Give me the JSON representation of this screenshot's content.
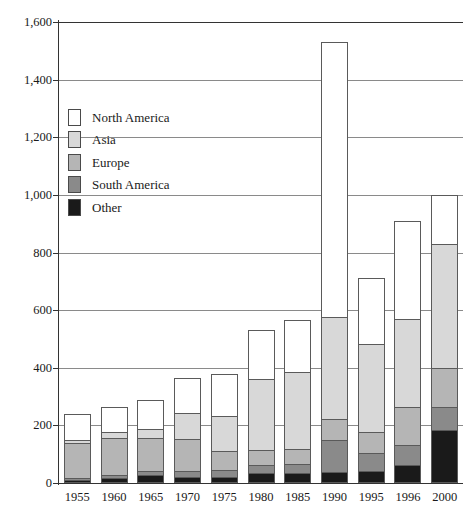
{
  "chart_data": {
    "type": "bar",
    "subtype": "stacked-bar",
    "title": "",
    "xlabel": "",
    "ylabel": "",
    "ylim": [
      0,
      1600
    ],
    "ytick_step": 200,
    "ytick_labels": [
      "0",
      "200",
      "400",
      "600",
      "800",
      "1,000",
      "1,200",
      "1,400",
      "1,600"
    ],
    "ytick_values": [
      0,
      200,
      400,
      600,
      800,
      1000,
      1200,
      1400,
      1600
    ],
    "grid": true,
    "grid_axis": "y",
    "legend_position": "upper-left-inside",
    "categories": [
      "1955",
      "1960",
      "1965",
      "1970",
      "1975",
      "1980",
      "1985",
      "1990",
      "1995",
      "1996",
      "2000"
    ],
    "series": [
      {
        "name": "Other",
        "color": "#1a1a1a",
        "values": [
          10,
          18,
          28,
          22,
          22,
          35,
          35,
          38,
          40,
          62,
          185
        ]
      },
      {
        "name": "South America",
        "color": "#8a8a8a",
        "values": [
          8,
          10,
          12,
          20,
          22,
          28,
          30,
          110,
          65,
          70,
          80
        ]
      },
      {
        "name": "Europe",
        "color": "#b5b5b5",
        "values": [
          122,
          130,
          118,
          112,
          66,
          52,
          52,
          75,
          72,
          133,
          135
        ]
      },
      {
        "name": "Asia",
        "color": "#d8d8d8",
        "values": [
          10,
          20,
          30,
          88,
          122,
          245,
          268,
          352,
          305,
          305,
          430
        ]
      },
      {
        "name": "North America",
        "color": "#ffffff",
        "values": [
          90,
          85,
          100,
          122,
          148,
          170,
          180,
          955,
          230,
          340,
          170
        ]
      }
    ],
    "totals": [
      240,
      263,
      288,
      364,
      380,
      530,
      565,
      1530,
      712,
      910,
      1000
    ]
  },
  "legend": {
    "items": [
      {
        "label": "North America",
        "color": "#ffffff"
      },
      {
        "label": "Asia",
        "color": "#d8d8d8"
      },
      {
        "label": "Europe",
        "color": "#b5b5b5"
      },
      {
        "label": "South America",
        "color": "#8a8a8a"
      },
      {
        "label": "Other",
        "color": "#1a1a1a"
      }
    ]
  },
  "axis": {
    "y_ticks": [
      {
        "value": 1600,
        "label": "1,600"
      },
      {
        "value": 1400,
        "label": "1,400"
      },
      {
        "value": 1200,
        "label": "1,200"
      },
      {
        "value": 1000,
        "label": "1,000"
      },
      {
        "value": 800,
        "label": "800"
      },
      {
        "value": 600,
        "label": "600"
      },
      {
        "value": 400,
        "label": "400"
      },
      {
        "value": 200,
        "label": "200"
      },
      {
        "value": 0,
        "label": "0"
      }
    ],
    "x_ticks": [
      "1955",
      "1960",
      "1965",
      "1970",
      "1975",
      "1980",
      "1985",
      "1990",
      "1995",
      "1996",
      "2000"
    ]
  },
  "colors": {
    "axis": "#333333",
    "gridline": "#8a8a8a",
    "bar_outline": "#5a5a5a",
    "background": "#ffffff"
  }
}
